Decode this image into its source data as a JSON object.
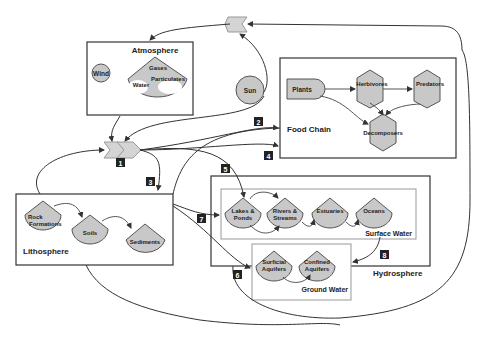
{
  "diagram": {
    "boxes": {
      "atmosphere": {
        "title": "Atmosphere"
      },
      "food_chain": {
        "title": "Food Chain"
      },
      "lithosphere": {
        "title": "Lithosphere"
      },
      "hydrosphere": {
        "title": "Hydrosphere"
      },
      "surface_water": {
        "title": "Surface Water"
      },
      "ground_water": {
        "title": "Ground Water"
      }
    },
    "nodes": {
      "wind": "Wind",
      "gases": "Gases",
      "particulates": "Particulates",
      "water": "Water",
      "sun": "Sun",
      "plants": "Plants",
      "herbivores": "Herbivores",
      "predators": "Predators",
      "decomposers": "Decomposers",
      "rock_formations_1": "Rock",
      "rock_formations_2": "Formations",
      "soils": "Soils",
      "sediments": "Sediments",
      "lakes_1": "Lakes &",
      "lakes_2": "Ponds",
      "rivers_1": "Rivers &",
      "rivers_2": "Streams",
      "estuaries": "Estuaries",
      "oceans": "Oceans",
      "surficial_1": "Surficial",
      "surficial_2": "Aquifers",
      "confined_1": "Confined",
      "confined_2": "Aquifers"
    },
    "pathway_labels": [
      "1",
      "2",
      "3",
      "4",
      "5",
      "6",
      "7",
      "8"
    ],
    "colors": {
      "node_fill": "#c8c8c8",
      "chevron_fill": "#d4d4d4",
      "line": "#333333",
      "label_bg": "#222222"
    }
  }
}
